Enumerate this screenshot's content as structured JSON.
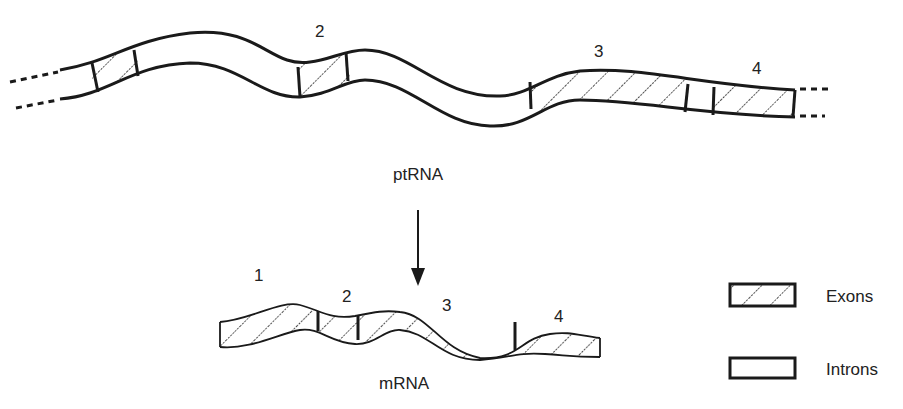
{
  "diagram": {
    "top_strand": {
      "label": "ptRNA",
      "exon_labels": [
        "2",
        "3",
        "4"
      ]
    },
    "bottom_strand": {
      "label": "mRNA",
      "exon_labels": [
        "1",
        "2",
        "3",
        "4"
      ]
    },
    "arrow": {
      "direction": "down"
    },
    "legend": {
      "items": [
        {
          "label": "Exons",
          "pattern": "hatched"
        },
        {
          "label": "Introns",
          "pattern": "blank"
        }
      ]
    },
    "colors": {
      "stroke": "#1a1a1a",
      "background": "#ffffff"
    }
  }
}
